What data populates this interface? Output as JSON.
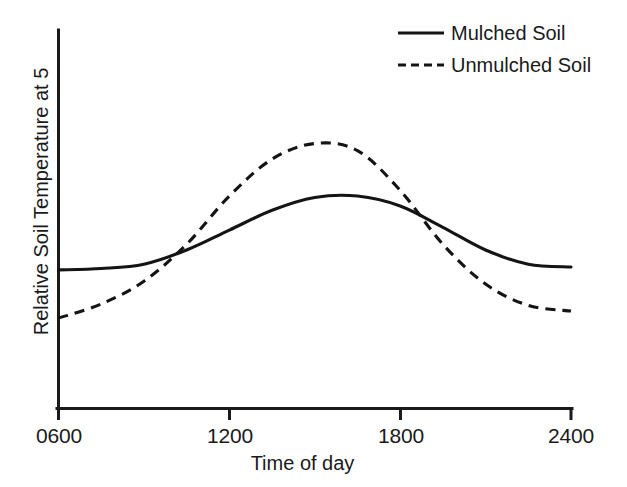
{
  "chart_data": {
    "type": "line",
    "title": "",
    "xlabel": "Time of day",
    "ylabel": "Relative Soil Temperature at 5",
    "xticks": [
      "0600",
      "1200",
      "1800",
      "2400"
    ],
    "xtick_values": [
      600,
      1200,
      1800,
      2400
    ],
    "xlim": [
      600,
      2400
    ],
    "ylim": [
      0,
      10
    ],
    "yticks": [],
    "grid": false,
    "legend_position": "top-right",
    "x": [
      600,
      750,
      900,
      1050,
      1200,
      1350,
      1500,
      1650,
      1800,
      1950,
      2100,
      2250,
      2400
    ],
    "series": [
      {
        "name": "Mulched Soil",
        "style": "solid",
        "color": "#141414",
        "values": [
          4.3,
          4.35,
          4.5,
          5.0,
          5.7,
          6.4,
          6.85,
          6.9,
          6.55,
          5.8,
          5.0,
          4.5,
          4.4
        ]
      },
      {
        "name": "Unmulched Soil",
        "style": "dashed",
        "color": "#141414",
        "values": [
          2.6,
          3.1,
          3.9,
          5.2,
          6.9,
          8.2,
          8.75,
          8.5,
          7.1,
          5.2,
          3.8,
          3.05,
          2.85
        ]
      }
    ],
    "annotations": [
      {
        "label": "curves-cross-morning",
        "x": 1035,
        "y": 4.95
      },
      {
        "label": "curves-cross-evening",
        "x": 1790,
        "y": 6.6
      }
    ]
  },
  "legend": {
    "items": [
      {
        "label": "Mulched Soil",
        "style": "solid"
      },
      {
        "label": "Unmulched Soil",
        "style": "dashed"
      }
    ]
  },
  "axes": {
    "x_label": "Time of day",
    "y_label": "Relative Soil Temperature at 5",
    "x_tick_labels": [
      "0600",
      "1200",
      "1800",
      "2400"
    ]
  }
}
